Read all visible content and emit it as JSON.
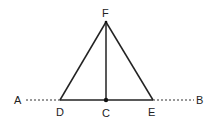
{
  "diagram": {
    "type": "geometry",
    "points": {
      "A": {
        "label": "A",
        "x": 18,
        "y": 100
      },
      "B": {
        "label": "B",
        "x": 200,
        "y": 100
      },
      "C": {
        "label": "C",
        "x": 106,
        "y": 100
      },
      "D": {
        "label": "D",
        "x": 60,
        "y": 100
      },
      "E": {
        "label": "E",
        "x": 153,
        "y": 100
      },
      "F": {
        "label": "F",
        "x": 106,
        "y": 22
      }
    },
    "segments": [
      {
        "from": "D",
        "to": "F",
        "style": "solid"
      },
      {
        "from": "F",
        "to": "E",
        "style": "solid"
      },
      {
        "from": "D",
        "to": "E",
        "style": "solid"
      },
      {
        "from": "F",
        "to": "C",
        "style": "solid"
      },
      {
        "from": "A",
        "to": "D",
        "style": "dashed"
      },
      {
        "from": "E",
        "to": "B",
        "style": "dashed"
      }
    ],
    "colors": {
      "line": "#222222",
      "label": "#222222"
    }
  }
}
